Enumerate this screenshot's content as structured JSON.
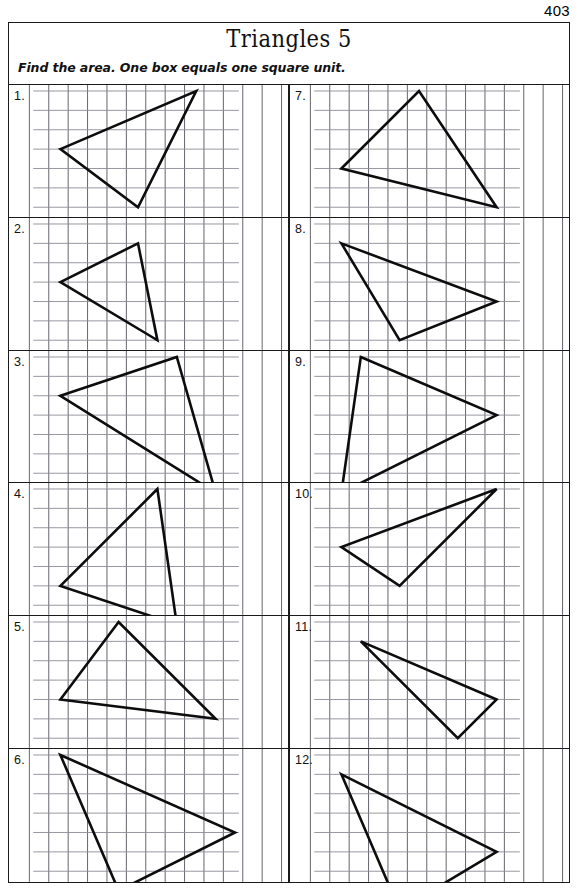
{
  "page": {
    "number": "403"
  },
  "header": {
    "title": "Triangles 5",
    "instruction": "Find the area. One box equals one square unit."
  },
  "grid": {
    "cell_size_px": 19.4,
    "line_color_horizontal": "#8c8c96",
    "line_color_vertical": "#55555e",
    "triangle_color": "#0d0d0d"
  },
  "problems": [
    {
      "number": "1.",
      "vertices": [
        [
          1,
          3
        ],
        [
          8,
          0
        ],
        [
          5,
          6
        ]
      ]
    },
    {
      "number": "2.",
      "vertices": [
        [
          1,
          3
        ],
        [
          5,
          1
        ],
        [
          6,
          6
        ]
      ]
    },
    {
      "number": "3.",
      "vertices": [
        [
          1,
          2
        ],
        [
          7,
          0
        ],
        [
          9,
          7
        ]
      ]
    },
    {
      "number": "4.",
      "vertices": [
        [
          6,
          0
        ],
        [
          1,
          5
        ],
        [
          7,
          7
        ]
      ]
    },
    {
      "number": "5.",
      "vertices": [
        [
          4,
          0
        ],
        [
          1,
          4
        ],
        [
          9,
          5
        ]
      ]
    },
    {
      "number": "6.",
      "vertices": [
        [
          1,
          0
        ],
        [
          10,
          4
        ],
        [
          4,
          7
        ]
      ]
    },
    {
      "number": "7.",
      "vertices": [
        [
          1,
          4
        ],
        [
          5,
          0
        ],
        [
          9,
          6
        ]
      ]
    },
    {
      "number": "8.",
      "vertices": [
        [
          1,
          1
        ],
        [
          9,
          4
        ],
        [
          4,
          6
        ]
      ]
    },
    {
      "number": "9.",
      "vertices": [
        [
          2,
          0
        ],
        [
          9,
          3
        ],
        [
          1,
          7
        ]
      ]
    },
    {
      "number": "10.",
      "vertices": [
        [
          9,
          0
        ],
        [
          1,
          3
        ],
        [
          4,
          5
        ]
      ]
    },
    {
      "number": "11.",
      "vertices": [
        [
          2,
          1
        ],
        [
          9,
          4
        ],
        [
          7,
          6
        ]
      ]
    },
    {
      "number": "12.",
      "vertices": [
        [
          1,
          1
        ],
        [
          9,
          5
        ],
        [
          4,
          8
        ]
      ]
    }
  ]
}
